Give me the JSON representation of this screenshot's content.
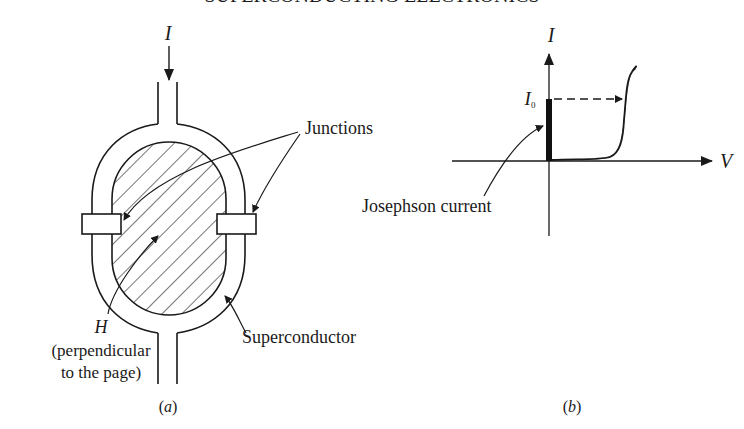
{
  "figure": {
    "header_fragment": "SUPERCONDUCTING ELECTRONICS",
    "panel_a": {
      "caption": "(a)",
      "current_label": "I",
      "junctions_label": "Junctions",
      "superconductor_label": "Superconductor",
      "field_label": "H",
      "field_note_line1": "(perpendicular",
      "field_note_line2": "to the page)"
    },
    "panel_b": {
      "caption": "(b)",
      "y_axis_label": "I",
      "x_axis_label": "V",
      "critical_current_label": "I",
      "critical_current_subscript": "0",
      "josephson_label": "Josephson current"
    },
    "colors": {
      "ink": "#1a1a1a",
      "background": "#ffffff"
    }
  }
}
